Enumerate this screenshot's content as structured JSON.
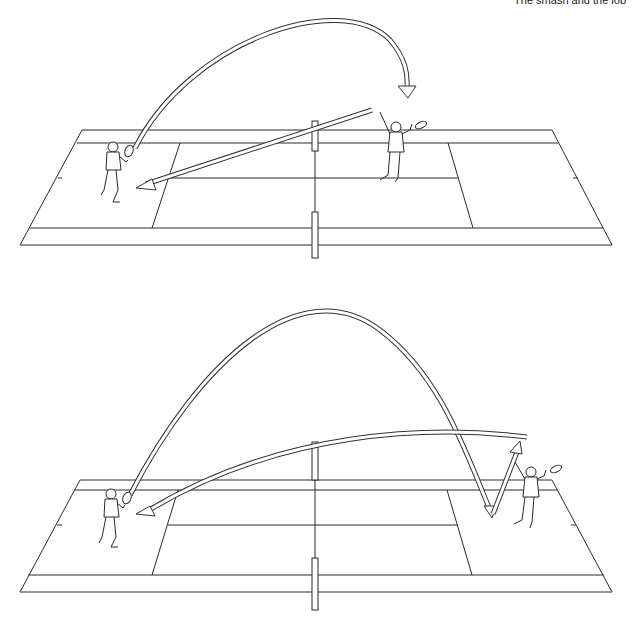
{
  "header": {
    "caption": "The smash and the lob"
  },
  "diagrams": [
    {
      "id": "smash",
      "description": "Top diagram: a lob from the left player is answered by an overhead smash from the right player at the net, returned cross-court to the left player's side.",
      "players": [
        "left-baseline-player",
        "right-net-player-smashing"
      ],
      "trajectories": [
        "high-lob-arc",
        "smash-return-arrow"
      ]
    },
    {
      "id": "lob",
      "description": "Bottom diagram: a high lob lands deep behind the right player near the baseline, who retreats and returns a lob back cross-court to the left player.",
      "players": [
        "left-baseline-player",
        "right-baseline-player"
      ],
      "trajectories": [
        "deep-lob-arc",
        "bounce-rebound-arrow",
        "return-lob-arrow"
      ]
    }
  ],
  "colors": {
    "line": "#2a2a2a",
    "background": "#ffffff"
  }
}
